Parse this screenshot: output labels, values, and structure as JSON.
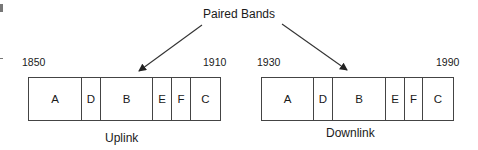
{
  "diagram": {
    "title": "Paired Bands",
    "uplink": {
      "caption": "Uplink",
      "start_label": "1850",
      "end_label": "1910",
      "segments": [
        {
          "label": "A",
          "width": 53
        },
        {
          "label": "D",
          "width": 19
        },
        {
          "label": "B",
          "width": 52
        },
        {
          "label": "E",
          "width": 19
        },
        {
          "label": "F",
          "width": 19
        },
        {
          "label": "C",
          "width": 30
        }
      ]
    },
    "downlink": {
      "caption": "Downlink",
      "start_label": "1930",
      "end_label": "1990",
      "segments": [
        {
          "label": "A",
          "width": 52
        },
        {
          "label": "D",
          "width": 19
        },
        {
          "label": "B",
          "width": 53
        },
        {
          "label": "E",
          "width": 19
        },
        {
          "label": "F",
          "width": 18
        },
        {
          "label": "C",
          "width": 31
        }
      ]
    },
    "colors": {
      "line": "#444444",
      "text": "#1a1a1a",
      "background": "#ffffff"
    }
  }
}
